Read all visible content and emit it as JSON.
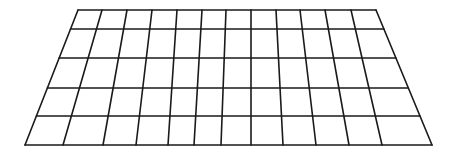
{
  "diagram": {
    "type": "perspective-grid",
    "columns": 12,
    "rows": 5,
    "line_color": "#1a1a1a",
    "background": "#ffffff",
    "top_edge_x": [
      78,
      102,
      127,
      152,
      177,
      202,
      226,
      251,
      276,
      300,
      325,
      351,
      376
    ],
    "bottom_edge_x": [
      25,
      63,
      103,
      136,
      168,
      194,
      221,
      251,
      283,
      316,
      349,
      382,
      432
    ],
    "row_y": [
      10,
      29,
      58,
      88,
      116,
      145
    ]
  }
}
